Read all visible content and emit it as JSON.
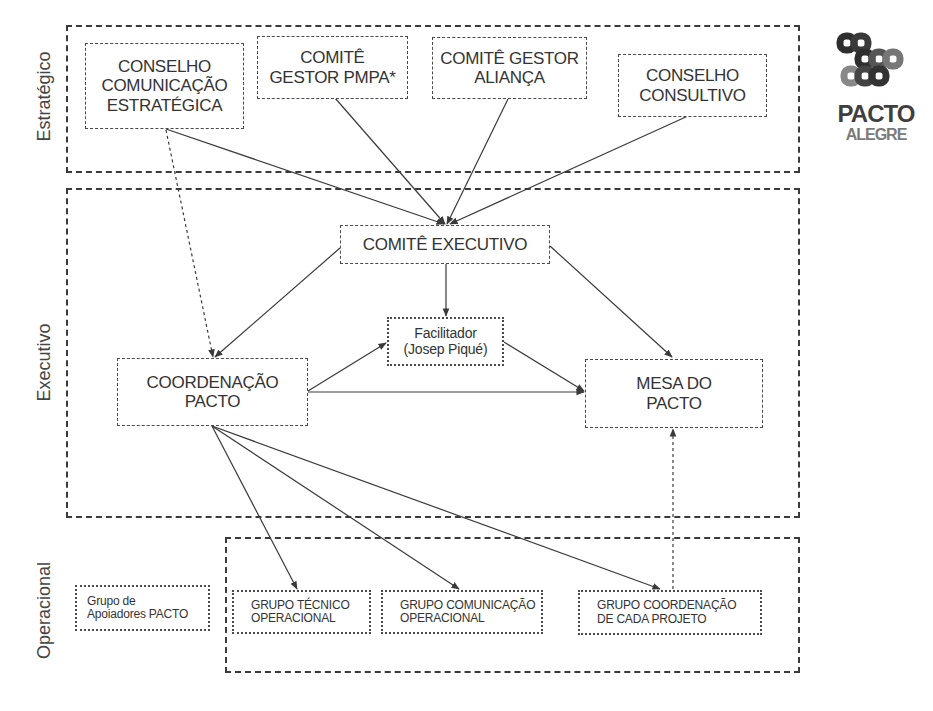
{
  "lanes": [
    {
      "id": "estrategico",
      "label": "Estratégico"
    },
    {
      "id": "executivo",
      "label": "Executivo"
    },
    {
      "id": "operacional",
      "label": "Operacional"
    }
  ],
  "nodes": {
    "conselho_comunicacao": {
      "lines": [
        "CONSELHO",
        "COMUNICAÇÃO",
        "ESTRATÉGICA"
      ]
    },
    "comite_gestor_pmpa": {
      "lines": [
        "COMITÊ",
        "GESTOR PMPA*"
      ]
    },
    "comite_gestor_alianca": {
      "lines": [
        "COMITÊ GESTOR",
        "ALIANÇA"
      ]
    },
    "conselho_consultivo": {
      "lines": [
        "CONSELHO",
        "CONSULTIVO"
      ]
    },
    "comite_executivo": {
      "lines": [
        "COMITÊ EXECUTIVO"
      ]
    },
    "facilitador": {
      "lines": [
        "Facilitador",
        "(Josep Piqué)"
      ]
    },
    "coordenacao_pacto": {
      "lines": [
        "COORDENAÇÃO",
        "PACTO"
      ]
    },
    "mesa_do_pacto": {
      "lines": [
        "MESA DO",
        "PACTO"
      ]
    },
    "grupo_apoiadores": {
      "lines": [
        "Grupo de",
        "Apoiadores PACTO"
      ]
    },
    "grupo_tecnico": {
      "lines": [
        "GRUPO TÉCNICO",
        "OPERACIONAL"
      ]
    },
    "grupo_comunicacao": {
      "lines": [
        "GRUPO COMUNICAÇÃO",
        "OPERACIONAL"
      ]
    },
    "grupo_coordenacao": {
      "lines": [
        "GRUPO COORDENAÇÃO",
        "DE CADA PROJETO"
      ]
    }
  },
  "edges": [
    {
      "from": "conselho_comunicacao",
      "to": "comite_executivo",
      "style": "solid"
    },
    {
      "from": "comite_gestor_pmpa",
      "to": "comite_executivo",
      "style": "solid"
    },
    {
      "from": "comite_gestor_alianca",
      "to": "comite_executivo",
      "style": "solid"
    },
    {
      "from": "conselho_consultivo",
      "to": "comite_executivo",
      "style": "solid"
    },
    {
      "from": "conselho_comunicacao",
      "to": "coordenacao_pacto",
      "style": "dashed"
    },
    {
      "from": "comite_executivo",
      "to": "coordenacao_pacto",
      "style": "solid"
    },
    {
      "from": "comite_executivo",
      "to": "facilitador",
      "style": "solid"
    },
    {
      "from": "comite_executivo",
      "to": "mesa_do_pacto",
      "style": "solid"
    },
    {
      "from": "coordenacao_pacto",
      "to": "facilitador",
      "style": "solid"
    },
    {
      "from": "facilitador",
      "to": "mesa_do_pacto",
      "style": "solid"
    },
    {
      "from": "coordenacao_pacto",
      "to": "mesa_do_pacto",
      "style": "solid"
    },
    {
      "from": "coordenacao_pacto",
      "to": "grupo_tecnico",
      "style": "solid"
    },
    {
      "from": "coordenacao_pacto",
      "to": "grupo_comunicacao",
      "style": "solid"
    },
    {
      "from": "coordenacao_pacto",
      "to": "grupo_coordenacao",
      "style": "solid"
    },
    {
      "from": "grupo_coordenacao",
      "to": "mesa_do_pacto",
      "style": "dashed"
    }
  ],
  "logo": {
    "line1": "PACTO",
    "line2": "ALEGRE"
  },
  "colors": {
    "line": "#3a3a3a",
    "text": "#333333",
    "background": "#ffffff"
  }
}
